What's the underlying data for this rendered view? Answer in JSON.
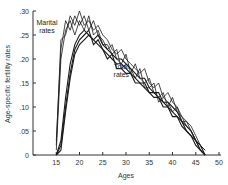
{
  "chart_data": {
    "type": "line",
    "title": "",
    "xlabel": "Ages",
    "ylabel": "Age-specific fertility rates",
    "xlim": [
      10,
      50
    ],
    "ylim": [
      0,
      0.3
    ],
    "x_ticks": [
      15,
      20,
      25,
      30,
      35,
      40,
      45,
      50
    ],
    "x_tick_labels": [
      "15",
      "20",
      "25",
      "30",
      "35",
      "40",
      "45",
      "50"
    ],
    "y_ticks": [
      0,
      0.05,
      0.1,
      0.15,
      0.2,
      0.25,
      0.3
    ],
    "y_tick_labels": [
      "0",
      ".05",
      ".10",
      ".15",
      ".20",
      ".25",
      ".30"
    ],
    "grid": false,
    "legend": "none (inline annotations)",
    "annotations": [
      {
        "text": "Marital\nrates",
        "x": 13,
        "y": 0.27
      },
      {
        "text": "Total\nrates",
        "x": 29,
        "y": 0.18
      }
    ],
    "x": [
      15,
      16,
      17,
      18,
      19,
      20,
      21,
      22,
      23,
      24,
      25,
      26,
      27,
      28,
      29,
      30,
      31,
      32,
      33,
      34,
      35,
      36,
      37,
      38,
      39,
      40,
      41,
      42,
      43,
      44,
      45,
      46,
      47
    ],
    "series": [
      {
        "name": "Marital rates A",
        "group": "marital",
        "values": [
          0.02,
          0.24,
          0.25,
          0.29,
          0.27,
          0.3,
          0.27,
          0.28,
          0.26,
          0.27,
          0.25,
          0.24,
          0.22,
          0.21,
          0.22,
          0.2,
          0.19,
          0.18,
          0.17,
          0.18,
          0.15,
          0.14,
          0.15,
          0.12,
          0.13,
          0.11,
          0.1,
          0.08,
          0.07,
          0.06,
          0.04,
          0.02,
          0.01
        ]
      },
      {
        "name": "Marital rates B",
        "group": "marital",
        "values": [
          0.03,
          0.22,
          0.28,
          0.26,
          0.29,
          0.27,
          0.29,
          0.26,
          0.28,
          0.25,
          0.24,
          0.22,
          0.23,
          0.2,
          0.19,
          0.21,
          0.17,
          0.19,
          0.16,
          0.15,
          0.16,
          0.13,
          0.12,
          0.13,
          0.1,
          0.12,
          0.09,
          0.08,
          0.06,
          0.05,
          0.03,
          0.02,
          0.01
        ]
      },
      {
        "name": "Marital rates C",
        "group": "marital",
        "values": [
          0.01,
          0.2,
          0.26,
          0.28,
          0.25,
          0.28,
          0.26,
          0.29,
          0.25,
          0.26,
          0.23,
          0.23,
          0.21,
          0.22,
          0.18,
          0.19,
          0.18,
          0.16,
          0.18,
          0.14,
          0.14,
          0.15,
          0.11,
          0.12,
          0.11,
          0.09,
          0.1,
          0.07,
          0.07,
          0.05,
          0.03,
          0.01,
          0.0
        ]
      },
      {
        "name": "Total rates A",
        "group": "total",
        "values": [
          0.0,
          0.03,
          0.12,
          0.19,
          0.23,
          0.25,
          0.26,
          0.25,
          0.24,
          0.25,
          0.23,
          0.22,
          0.21,
          0.2,
          0.2,
          0.19,
          0.18,
          0.17,
          0.16,
          0.16,
          0.14,
          0.13,
          0.13,
          0.11,
          0.11,
          0.1,
          0.09,
          0.07,
          0.06,
          0.05,
          0.03,
          0.02,
          0.0
        ]
      },
      {
        "name": "Total rates B",
        "group": "total",
        "values": [
          0.0,
          0.02,
          0.1,
          0.17,
          0.22,
          0.24,
          0.25,
          0.26,
          0.23,
          0.24,
          0.22,
          0.21,
          0.2,
          0.19,
          0.19,
          0.18,
          0.17,
          0.16,
          0.15,
          0.15,
          0.13,
          0.13,
          0.12,
          0.11,
          0.1,
          0.09,
          0.08,
          0.07,
          0.05,
          0.04,
          0.03,
          0.01,
          0.0
        ]
      },
      {
        "name": "Total rates C",
        "group": "total",
        "values": [
          0.0,
          0.01,
          0.09,
          0.16,
          0.21,
          0.23,
          0.24,
          0.25,
          0.24,
          0.23,
          0.22,
          0.2,
          0.21,
          0.18,
          0.18,
          0.17,
          0.17,
          0.15,
          0.15,
          0.14,
          0.13,
          0.12,
          0.12,
          0.1,
          0.1,
          0.08,
          0.08,
          0.06,
          0.05,
          0.04,
          0.02,
          0.01,
          0.0
        ]
      }
    ]
  },
  "style": {
    "line_color": "#1a1a1a",
    "axis_color": "#333333",
    "background": "#ffffff"
  }
}
